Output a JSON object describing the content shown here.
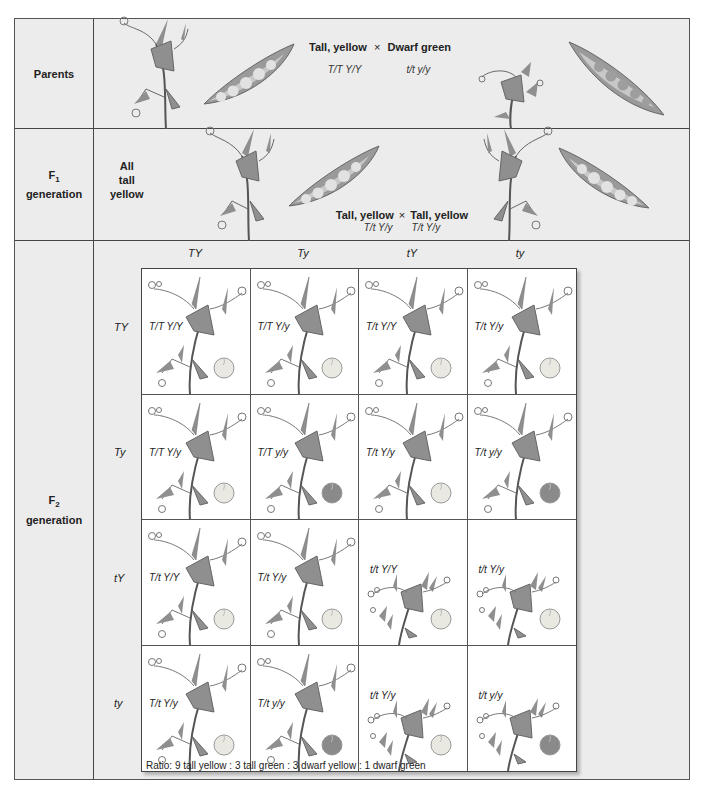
{
  "rows": {
    "parents": {
      "label": "Parents",
      "cross_phenotype_left": "Tall, yellow",
      "cross_symbol": "×",
      "cross_phenotype_right": "Dwarf green",
      "genotype_left": "T/T Y/Y",
      "genotype_right": "t/t  y/y"
    },
    "f1": {
      "label_main": "F",
      "label_sub": "1",
      "label_tail": "generation",
      "note_line1": "All",
      "note_line2": "tall",
      "note_line3": "yellow",
      "cross_phenotype_left": "Tall, yellow",
      "cross_symbol": "×",
      "cross_phenotype_right": "Tall, yellow",
      "genotype_left": "T/t Y/y",
      "genotype_right": "T/t  Y/y"
    },
    "f2": {
      "label_main": "F",
      "label_sub": "2",
      "label_tail": "generation",
      "gametes_top": [
        "TY",
        "Ty",
        "tY",
        "ty"
      ],
      "gametes_side": [
        "TY",
        "Ty",
        "tY",
        "ty"
      ],
      "cells": [
        [
          {
            "genotype": "T/T Y/Y",
            "tall": true,
            "seed": "yellow"
          },
          {
            "genotype": "T/T Y/y",
            "tall": true,
            "seed": "yellow"
          },
          {
            "genotype": "T/t Y/Y",
            "tall": true,
            "seed": "yellow"
          },
          {
            "genotype": "T/t Y/y",
            "tall": true,
            "seed": "yellow"
          }
        ],
        [
          {
            "genotype": "T/T Y/y",
            "tall": true,
            "seed": "yellow"
          },
          {
            "genotype": "T/T y/y",
            "tall": true,
            "seed": "green"
          },
          {
            "genotype": "T/t Y/y",
            "tall": true,
            "seed": "yellow"
          },
          {
            "genotype": "T/t y/y",
            "tall": true,
            "seed": "green"
          }
        ],
        [
          {
            "genotype": "T/t Y/Y",
            "tall": true,
            "seed": "yellow"
          },
          {
            "genotype": "T/t Y/y",
            "tall": true,
            "seed": "yellow"
          },
          {
            "genotype": "t/t Y/Y",
            "tall": false,
            "seed": "yellow"
          },
          {
            "genotype": "t/t Y/y",
            "tall": false,
            "seed": "yellow"
          }
        ],
        [
          {
            "genotype": "T/t Y/y",
            "tall": true,
            "seed": "yellow"
          },
          {
            "genotype": "T/t y/y",
            "tall": true,
            "seed": "green"
          },
          {
            "genotype": "t/t Y/y",
            "tall": false,
            "seed": "yellow"
          },
          {
            "genotype": "t/t y/y",
            "tall": false,
            "seed": "green"
          }
        ]
      ],
      "ratio": "Ratio: 9 tall yellow : 3 tall green : 3 dwarf yellow : 1 dwarf green"
    }
  },
  "colors": {
    "background": "#ececec",
    "border": "#444444",
    "yellow_seed": "#e9e9e2",
    "green_seed": "#8a8a8a",
    "leaf": "#8f8f8f",
    "pod": "#9a9a9a"
  }
}
